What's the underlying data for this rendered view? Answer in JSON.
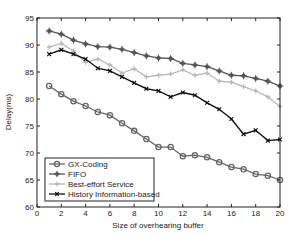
{
  "chart_data": {
    "type": "line",
    "title": "",
    "xlabel": "Size of overhearing buffer",
    "ylabel": "Delay(ms)",
    "xlim": [
      0,
      20
    ],
    "ylim": [
      60,
      95
    ],
    "xticks": [
      0,
      2,
      4,
      6,
      8,
      10,
      12,
      14,
      16,
      18,
      20
    ],
    "yticks": [
      60,
      65,
      70,
      75,
      80,
      85,
      90,
      95
    ],
    "grid": false,
    "legend_position": "lower left",
    "x": [
      1,
      2,
      3,
      4,
      5,
      6,
      7,
      8,
      9,
      10,
      11,
      12,
      13,
      14,
      15,
      16,
      17,
      18,
      19,
      20
    ],
    "series": [
      {
        "name": "GX-Coding",
        "color": "#666666",
        "marker": "circle",
        "values": [
          82.4,
          80.9,
          79.6,
          78.7,
          77.6,
          77.0,
          75.5,
          74.1,
          72.6,
          71.1,
          71.1,
          69.4,
          69.6,
          69.2,
          68.3,
          67.4,
          67.0,
          66.1,
          65.8,
          65.0
        ]
      },
      {
        "name": "FIFO",
        "color": "#555555",
        "marker": "diamond",
        "values": [
          92.6,
          92.0,
          90.9,
          90.2,
          89.7,
          89.6,
          89.2,
          88.6,
          88.0,
          87.6,
          87.5,
          86.6,
          86.3,
          86.0,
          85.2,
          84.4,
          84.3,
          83.8,
          83.3,
          82.4
        ]
      },
      {
        "name": "Best-effort Service",
        "color": "#b8b8b8",
        "marker": "plus",
        "values": [
          89.6,
          90.3,
          88.9,
          86.8,
          87.4,
          86.3,
          84.8,
          85.6,
          84.1,
          84.4,
          84.6,
          85.4,
          84.4,
          84.8,
          83.3,
          83.1,
          82.3,
          81.5,
          80.4,
          78.6
        ]
      },
      {
        "name": "History Information-based",
        "color": "#111111",
        "marker": "x",
        "values": [
          88.3,
          89.1,
          88.3,
          87.4,
          85.7,
          85.2,
          84.1,
          83.0,
          81.9,
          81.5,
          80.4,
          81.2,
          80.7,
          79.3,
          78.1,
          76.3,
          73.5,
          74.2,
          72.3,
          72.5
        ]
      }
    ]
  }
}
